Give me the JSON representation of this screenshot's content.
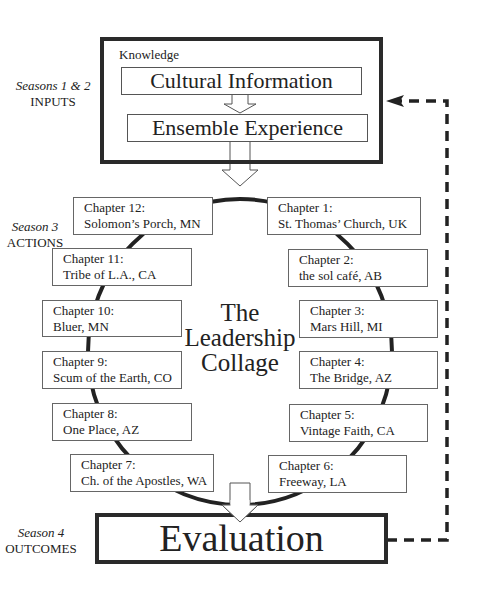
{
  "labels": {
    "inputs": {
      "season": "Seasons 1 & 2",
      "phase": "INPUTS"
    },
    "actions": {
      "season": "Season 3",
      "phase": "ACTIONS"
    },
    "outcomes": {
      "season": "Season 4",
      "phase": "OUTCOMES"
    }
  },
  "knowledge": {
    "title": "Knowledge",
    "step1": "Cultural Information",
    "step2": "Ensemble Experience"
  },
  "center": {
    "line1": "The",
    "line2": "Leadership",
    "line3": "Collage"
  },
  "chapters": [
    {
      "title": "Chapter 1:",
      "name": "St. Thomas’ Church, UK"
    },
    {
      "title": "Chapter 2:",
      "name": "the sol café, AB"
    },
    {
      "title": "Chapter 3:",
      "name": "Mars Hill, MI"
    },
    {
      "title": "Chapter 4:",
      "name": "The Bridge, AZ"
    },
    {
      "title": "Chapter 5:",
      "name": "Vintage Faith, CA"
    },
    {
      "title": "Chapter 6:",
      "name": "Freeway, LA"
    },
    {
      "title": "Chapter 7:",
      "name": "Ch. of the Apostles, WA"
    },
    {
      "title": "Chapter 8:",
      "name": "One Place, AZ"
    },
    {
      "title": "Chapter 9:",
      "name": "Scum of the Earth, CO"
    },
    {
      "title": "Chapter 10:",
      "name": "Bluer, MN"
    },
    {
      "title": "Chapter 11:",
      "name": "Tribe of L.A., CA"
    },
    {
      "title": "Chapter 12:",
      "name": "Solomon’s Porch, MN"
    }
  ],
  "evaluation": "Evaluation"
}
